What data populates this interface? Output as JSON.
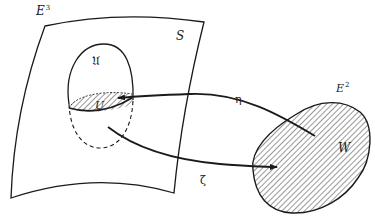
{
  "diagram": {
    "labels": {
      "ambient_space": "E",
      "ambient_space_dim": "3",
      "surface": "S",
      "neighborhood": "𝔘",
      "patch": "U",
      "map_eta": "η",
      "map_zeta": "ζ",
      "plane": "E",
      "plane_dim": "2",
      "region": "W"
    },
    "colors": {
      "stroke": "#1a1a1a",
      "background": "#ffffff",
      "hatch": "#333333"
    }
  }
}
